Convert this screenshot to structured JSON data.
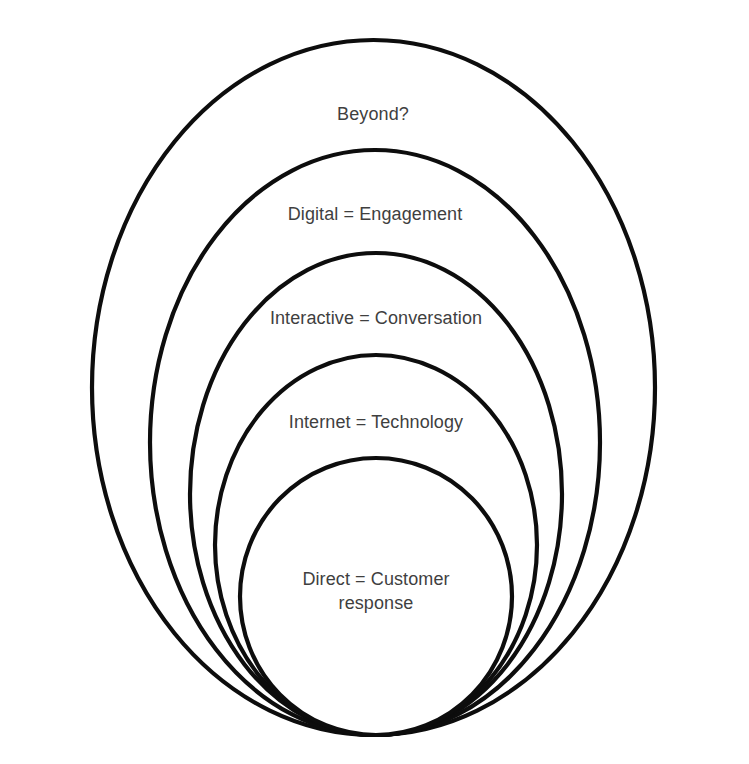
{
  "diagram": {
    "canvas": {
      "width": 749,
      "height": 764,
      "background": "#ffffff"
    },
    "stroke_color": "#0d0d0d",
    "stroke_width": 4.2,
    "fill_color": "#ffffff",
    "label_color": "#3f3f3f",
    "rings": [
      {
        "id": "ring-beyond",
        "label": "Beyond?",
        "level": 1,
        "cx": 373.5,
        "cy": 387.5,
        "rx": 281.5,
        "ry": 347.5,
        "label_x": 373,
        "label_y": 103
      },
      {
        "id": "ring-digital",
        "label": "Digital = Engagement",
        "level": 2,
        "cx": 375,
        "cy": 442.5,
        "rx": 225,
        "ry": 292.5,
        "label_x": 375,
        "label_y": 203
      },
      {
        "id": "ring-interactive",
        "label": "Interactive = Conversation",
        "level": 3,
        "cx": 376,
        "cy": 494,
        "rx": 186,
        "ry": 241,
        "label_x": 376,
        "label_y": 307
      },
      {
        "id": "ring-internet",
        "label": "Internet = Technology",
        "level": 4,
        "cx": 376,
        "cy": 545,
        "rx": 161,
        "ry": 190,
        "label_x": 376,
        "label_y": 411
      },
      {
        "id": "ring-direct",
        "label": "Direct = Customer\nresponse",
        "level": 5,
        "cx": 376,
        "cy": 596.5,
        "rx": 136,
        "ry": 138.5,
        "label_x": 376,
        "label_y": 568
      }
    ]
  }
}
